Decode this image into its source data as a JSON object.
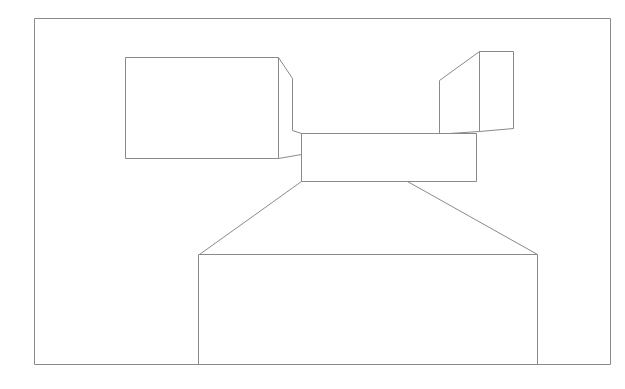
{
  "canvas": {
    "width": 625,
    "height": 389,
    "background": "#ffffff"
  },
  "stroke": {
    "color": "#8a8a8a",
    "width": 1
  },
  "shapes": [
    {
      "name": "outer-frame",
      "points": [
        [
          34,
          18
        ],
        [
          610,
          18
        ],
        [
          610,
          364
        ],
        [
          34,
          364
        ]
      ],
      "closed": true
    },
    {
      "name": "left-box-front",
      "points": [
        [
          125,
          57
        ],
        [
          278,
          57
        ],
        [
          278,
          158
        ],
        [
          125,
          158
        ]
      ],
      "closed": true
    },
    {
      "name": "left-box-side",
      "points": [
        [
          278,
          57
        ],
        [
          292,
          78
        ],
        [
          292,
          130
        ],
        [
          301,
          133
        ]
      ],
      "closed": false
    },
    {
      "name": "left-box-bottom-connector",
      "points": [
        [
          278,
          158
        ],
        [
          301,
          154
        ]
      ],
      "closed": false
    },
    {
      "name": "right-box-front",
      "points": [
        [
          479,
          51
        ],
        [
          513,
          51
        ],
        [
          513,
          128
        ],
        [
          479,
          131
        ]
      ],
      "closed": false
    },
    {
      "name": "right-box-front-left-edge",
      "points": [
        [
          479,
          51
        ],
        [
          479,
          131
        ]
      ],
      "closed": false
    },
    {
      "name": "right-box-side",
      "points": [
        [
          479,
          51
        ],
        [
          439,
          80
        ],
        [
          439,
          133
        ]
      ],
      "closed": false
    },
    {
      "name": "right-box-bottom-connector",
      "points": [
        [
          479,
          131
        ],
        [
          449,
          133
        ]
      ],
      "closed": false
    },
    {
      "name": "center-box",
      "points": [
        [
          301,
          133
        ],
        [
          476,
          133
        ],
        [
          476,
          181
        ],
        [
          301,
          181
        ]
      ],
      "closed": true
    },
    {
      "name": "left-diagonal",
      "points": [
        [
          301,
          181
        ],
        [
          199,
          254
        ]
      ],
      "closed": false
    },
    {
      "name": "right-diagonal",
      "points": [
        [
          407,
          181
        ],
        [
          537,
          254
        ]
      ],
      "closed": false
    },
    {
      "name": "bottom-box",
      "points": [
        [
          198,
          364
        ],
        [
          198,
          254
        ],
        [
          537,
          254
        ],
        [
          537,
          364
        ]
      ],
      "closed": false
    }
  ]
}
